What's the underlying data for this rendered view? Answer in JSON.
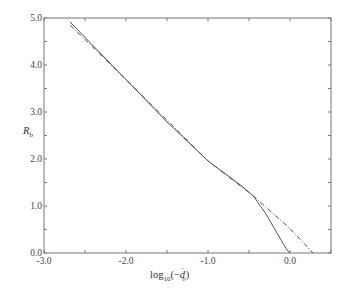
{
  "chart_data": {
    "type": "line",
    "title": "",
    "xlabel": "log10(-d'b)",
    "xlabel_parts": {
      "main": "log",
      "sub": "10",
      "arg_open": "(−",
      "var": "d",
      "prime": "'",
      "var_sub": "b",
      "arg_close": ")"
    },
    "ylabel": "Rb",
    "ylabel_parts": {
      "main": "R",
      "sub": "b"
    },
    "xlim": [
      -3.0,
      0.5
    ],
    "ylim": [
      0.0,
      5.0
    ],
    "x_ticks": [
      -3.0,
      -2.5,
      -2.0,
      -1.5,
      -1.0,
      -0.5,
      0.0,
      0.5
    ],
    "x_tick_labels": [
      "-3.0",
      "-2.0",
      "-1.0",
      "0.0"
    ],
    "x_tick_label_values": [
      -3.0,
      -2.0,
      -1.0,
      0.0
    ],
    "y_ticks": [
      0.0,
      0.5,
      1.0,
      1.5,
      2.0,
      2.5,
      3.0,
      3.5,
      4.0,
      4.5,
      5.0
    ],
    "y_tick_labels": [
      "0.0",
      "1.0",
      "2.0",
      "3.0",
      "4.0",
      "5.0"
    ],
    "y_tick_label_values": [
      0.0,
      1.0,
      2.0,
      3.0,
      4.0,
      5.0
    ],
    "grid": false,
    "legend": null,
    "series": [
      {
        "name": "solid curve",
        "style": "solid",
        "x": [
          -2.68,
          -2.0,
          -1.5,
          -1.0,
          -0.6,
          -0.45,
          -0.3,
          -0.2,
          -0.1,
          -0.03,
          0.0
        ],
        "y": [
          4.91,
          3.69,
          2.79,
          1.96,
          1.44,
          1.22,
          0.85,
          0.55,
          0.25,
          0.05,
          0.0
        ]
      },
      {
        "name": "dash-dot asymptote",
        "style": "dash-dot",
        "x": [
          -2.68,
          -2.0,
          -1.0,
          -0.45,
          0.0,
          0.28
        ],
        "y": [
          4.85,
          3.69,
          1.96,
          1.22,
          0.52,
          0.0
        ]
      }
    ]
  }
}
